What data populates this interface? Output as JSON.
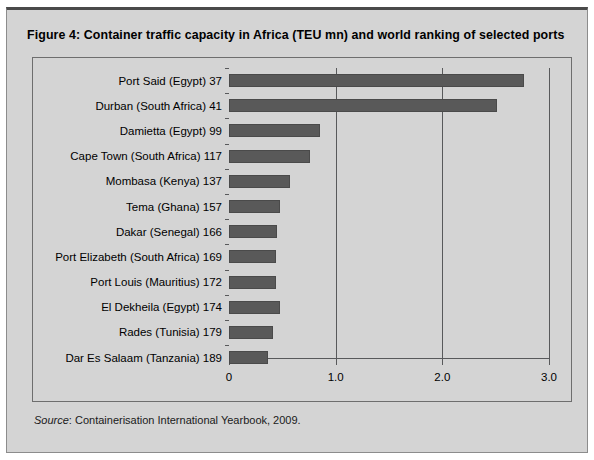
{
  "figure": {
    "title": "Figure 4:  Container traffic capacity in Africa (TEU mn) and world ranking of selected ports",
    "source_label": "Source",
    "source_text": ": Containerisation International Yearbook, 2009."
  },
  "colors": {
    "bar": "#595959",
    "panel": "#d4d4d4",
    "axis": "#58595b",
    "frame": "#6e6e6e"
  },
  "chart_data": {
    "type": "bar",
    "orientation": "horizontal",
    "title": "Figure 4:  Container traffic capacity in Africa (TEU mn) and world ranking of selected ports",
    "xlabel": "",
    "ylabel": "",
    "xlim": [
      0,
      3.0
    ],
    "xticks": [
      "0",
      "1.0",
      "2.0",
      "3.0"
    ],
    "xtick_values": [
      0,
      1.0,
      2.0,
      3.0
    ],
    "grid": "vertical gridlines at 1.0, 2.0, 3.0",
    "legend": "none",
    "units": "TEU mn",
    "categories": [
      "Port Said (Egypt) 37",
      "Durban (South Africa) 41",
      "Damietta (Egypt) 99",
      "Cape Town (South Africa) 117",
      "Mombasa (Kenya) 137",
      "Tema (Ghana) 157",
      "Dakar (Senegal) 166",
      "Port Elizabeth (South Africa) 169",
      "Port Louis (Mauritius) 172",
      "El Dekheila (Egypt) 174",
      "Rades (Tunisia) 179",
      "Dar Es Salaam (Tanzania) 189"
    ],
    "values": [
      2.77,
      2.51,
      0.85,
      0.76,
      0.57,
      0.48,
      0.45,
      0.44,
      0.44,
      0.48,
      0.41,
      0.37
    ],
    "ports": [
      {
        "label": "Port Said (Egypt) 37",
        "port": "Port Said",
        "country": "Egypt",
        "rank": 37,
        "value": 2.77
      },
      {
        "label": "Durban (South Africa) 41",
        "port": "Durban",
        "country": "South Africa",
        "rank": 41,
        "value": 2.51
      },
      {
        "label": "Damietta (Egypt) 99",
        "port": "Damietta",
        "country": "Egypt",
        "rank": 99,
        "value": 0.85
      },
      {
        "label": "Cape Town (South Africa) 117",
        "port": "Cape Town",
        "country": "South Africa",
        "rank": 117,
        "value": 0.76
      },
      {
        "label": "Mombasa (Kenya) 137",
        "port": "Mombasa",
        "country": "Kenya",
        "rank": 137,
        "value": 0.57
      },
      {
        "label": "Tema (Ghana) 157",
        "port": "Tema",
        "country": "Ghana",
        "rank": 157,
        "value": 0.48
      },
      {
        "label": "Dakar (Senegal) 166",
        "port": "Dakar",
        "country": "Senegal",
        "rank": 166,
        "value": 0.45
      },
      {
        "label": "Port Elizabeth (South Africa) 169",
        "port": "Port Elizabeth",
        "country": "South Africa",
        "rank": 169,
        "value": 0.44
      },
      {
        "label": "Port Louis (Mauritius) 172",
        "port": "Port Louis",
        "country": "Mauritius",
        "rank": 172,
        "value": 0.44
      },
      {
        "label": "El Dekheila (Egypt) 174",
        "port": "El Dekheila",
        "country": "Egypt",
        "rank": 174,
        "value": 0.48
      },
      {
        "label": "Rades (Tunisia) 179",
        "port": "Rades",
        "country": "Tunisia",
        "rank": 179,
        "value": 0.41
      },
      {
        "label": "Dar Es Salaam (Tanzania) 189",
        "port": "Dar Es Salaam",
        "country": "Tanzania",
        "rank": 189,
        "value": 0.37
      }
    ]
  }
}
